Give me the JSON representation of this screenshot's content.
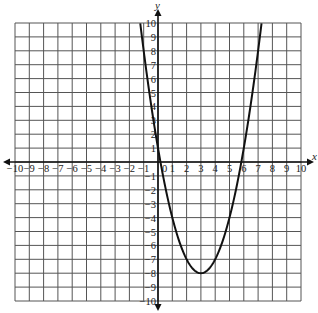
{
  "chart_data": {
    "type": "line",
    "title": "",
    "xlabel": "x",
    "ylabel": "y",
    "xlim": [
      -10,
      10
    ],
    "ylim": [
      -10,
      10
    ],
    "grid": true,
    "x_ticks": [
      -10,
      -9,
      -8,
      -7,
      -6,
      -5,
      -4,
      -3,
      -2,
      -1,
      0,
      1,
      2,
      3,
      4,
      5,
      6,
      7,
      8,
      9,
      10
    ],
    "y_ticks": [
      -10,
      -9,
      -8,
      -7,
      -6,
      -5,
      -4,
      -3,
      -2,
      -1,
      1,
      2,
      3,
      4,
      5,
      6,
      7,
      8,
      9,
      10
    ],
    "series": [
      {
        "name": "parabola",
        "equation": "y = x^2 - 6x + 1",
        "vertex": [
          3,
          -8
        ],
        "x_intercepts": [
          0.17,
          5.83
        ],
        "y_intercept": 1,
        "x": [
          -1.24,
          -1,
          0,
          1,
          2,
          3,
          4,
          5,
          6,
          7,
          7.24
        ],
        "y": [
          10,
          8,
          1,
          -4,
          -7,
          -8,
          -7,
          -4,
          1,
          8,
          10
        ]
      }
    ]
  },
  "colors": {
    "grid": "#555555",
    "axis": "#111111",
    "curve": "#111111",
    "background": "#ffffff"
  }
}
